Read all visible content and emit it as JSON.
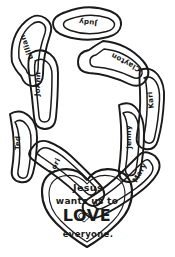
{
  "artwork": {
    "title": "Paper chain of names with heart pendant",
    "medium": "black and white line drawing / coloring page",
    "background_color": "#ffffff",
    "ink_color": "#1a1a1a"
  },
  "chain": {
    "label": "name-chain",
    "links": [
      {
        "id": "link-judy",
        "name": "Judy",
        "position": "top-center",
        "x": 88,
        "y": 22,
        "rotation": 186
      },
      {
        "id": "link-lillian",
        "name": "Lillian",
        "position": "top-left",
        "x": 27,
        "y": 47,
        "rotation": 250
      },
      {
        "id": "link-clayton",
        "name": "Clayton",
        "position": "top-right",
        "x": 126,
        "y": 62,
        "rotation": 208
      },
      {
        "id": "link-joann",
        "name": "JoAnn",
        "position": "left-upper",
        "x": 38,
        "y": 84,
        "rotation": 272
      },
      {
        "id": "link-kari",
        "name": "Kari",
        "position": "right-upper",
        "x": 151,
        "y": 100,
        "rotation": 264
      },
      {
        "id": "link-jenny",
        "name": "Jenny",
        "position": "right-lower",
        "x": 129,
        "y": 137,
        "rotation": 268
      },
      {
        "id": "link-ted",
        "name": "Ted",
        "position": "left-lower",
        "x": 18,
        "y": 143,
        "rotation": 272
      },
      {
        "id": "link-lori",
        "name": "Lori",
        "position": "left-bottom",
        "x": 55,
        "y": 166,
        "rotation": 298
      },
      {
        "id": "link-mary",
        "name": "Mary",
        "position": "right-bottom",
        "x": 140,
        "y": 173,
        "rotation": 300
      }
    ]
  },
  "heart": {
    "label": "heart-pendant",
    "lines": [
      {
        "id": "heart-line-1",
        "text": "Jesus"
      },
      {
        "id": "heart-line-2",
        "text": "wants us to"
      },
      {
        "id": "heart-line-3",
        "text": "LOVE"
      },
      {
        "id": "heart-line-4",
        "text": "everyone."
      }
    ],
    "full_message": "Jesus wants us to LOVE everyone.",
    "inner_icon": "small-heart-icon-inside-letter-o"
  }
}
